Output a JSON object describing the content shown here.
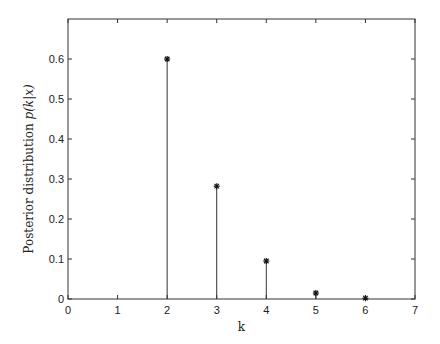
{
  "chart_data": {
    "type": "stem",
    "title": "",
    "xlabel": "k",
    "ylabel": "Posterior distribution p(k|x)",
    "ylabel_parts": {
      "text": "Posterior distribution ",
      "math": "p(k|x)"
    },
    "xlim": [
      0,
      7
    ],
    "ylim": [
      0,
      0.7
    ],
    "xticks": [
      0,
      1,
      2,
      3,
      4,
      5,
      6,
      7
    ],
    "yticks": [
      0,
      0.1,
      0.2,
      0.3,
      0.4,
      0.5,
      0.6
    ],
    "xtick_labels": [
      "0",
      "1",
      "2",
      "3",
      "4",
      "5",
      "6",
      "7"
    ],
    "ytick_labels": [
      "0",
      "0.1",
      "0.2",
      "0.3",
      "0.4",
      "0.5",
      "0.6"
    ],
    "x": [
      2,
      3,
      4,
      5,
      6
    ],
    "values": [
      0.6,
      0.282,
      0.095,
      0.015,
      0.002
    ],
    "marker": "*",
    "grid": false,
    "legend": null,
    "colors": {
      "stem": "#333333",
      "axes": "#333333",
      "background": "#ffffff"
    }
  },
  "layout": {
    "plot": {
      "left": 68,
      "right": 415,
      "top": 19,
      "bottom": 299
    }
  }
}
